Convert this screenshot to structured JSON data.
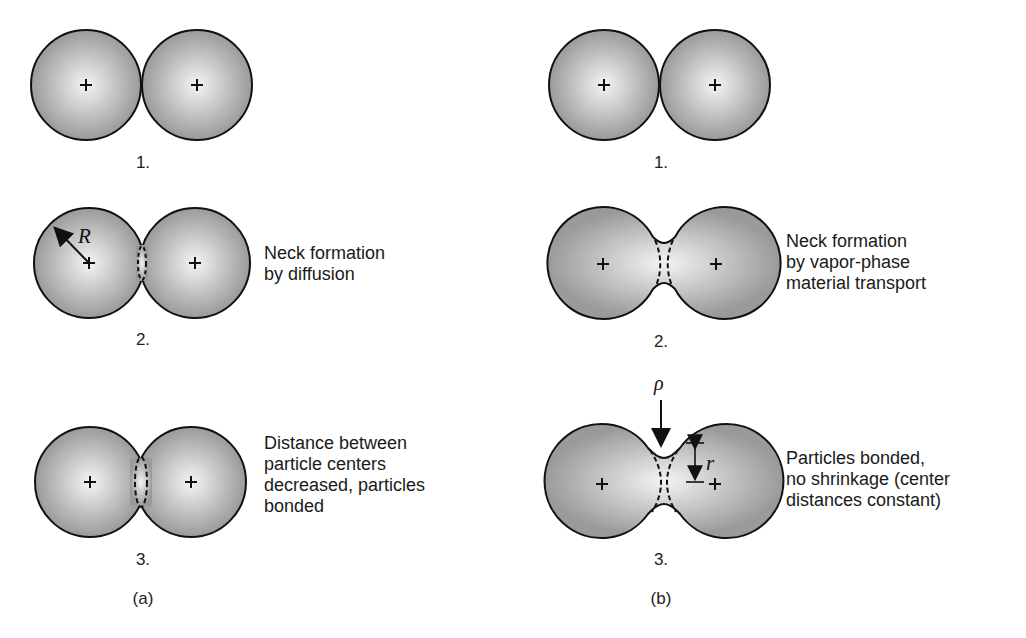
{
  "figure": {
    "panels": [
      {
        "id": "a",
        "label": "(a)",
        "stages": [
          {
            "number": "1.",
            "caption_lines": []
          },
          {
            "number": "2.",
            "caption_lines": [
              "Neck formation",
              "by diffusion"
            ],
            "symbol": "R"
          },
          {
            "number": "3.",
            "caption_lines": [
              "Distance between",
              "particle centers",
              "decreased, particles",
              "bonded"
            ]
          }
        ]
      },
      {
        "id": "b",
        "label": "(b)",
        "stages": [
          {
            "number": "1.",
            "caption_lines": []
          },
          {
            "number": "2.",
            "caption_lines": [
              "Neck formation",
              "by vapor-phase",
              "material transport"
            ]
          },
          {
            "number": "3.",
            "caption_lines": [
              "Particles bonded,",
              "no shrinkage (center",
              "distances constant)"
            ],
            "symbols": [
              "ρ",
              "r"
            ]
          }
        ]
      }
    ],
    "colors": {
      "particle_center": "#f4f4f4",
      "particle_edge": "#9a9a9a",
      "outline": "#111111"
    }
  }
}
